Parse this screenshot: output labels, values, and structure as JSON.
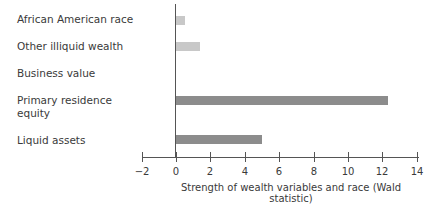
{
  "chart_data": {
    "type": "bar",
    "orientation": "horizontal",
    "title": "",
    "xlabel": "Strength of wealth variables and race (Wald statistic)",
    "ylabel": "",
    "xlim": [
      -2,
      14
    ],
    "xticks": [
      -2,
      0,
      2,
      4,
      6,
      8,
      10,
      12,
      14
    ],
    "grid": false,
    "legend": null,
    "categories": [
      "African American race",
      "Other illiquid wealth",
      "Business value",
      "Primary residence equity",
      "Liquid assets"
    ],
    "values": [
      0.5,
      1.4,
      0,
      12.3,
      5.0
    ],
    "bar_colors": [
      "#c8c8c8",
      "#c8c8c8",
      null,
      "#8c8c8c",
      "#8c8c8c"
    ]
  },
  "labels": {
    "cat0": "African American race",
    "cat1": "Other illiquid wealth",
    "cat2": "Business value",
    "cat3a": "Primary residence",
    "cat3b": "equity",
    "cat4": "Liquid assets"
  },
  "ticks": [
    "−2",
    "0",
    "2",
    "4",
    "6",
    "8",
    "10",
    "12",
    "14"
  ],
  "xlabel": "Strength of wealth variables and race (Wald statistic)"
}
